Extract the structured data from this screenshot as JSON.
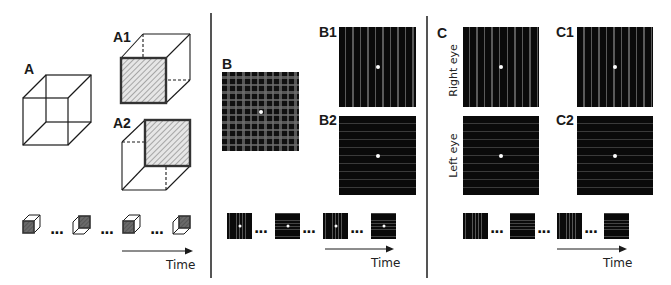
{
  "panels": {
    "A": {
      "label": "A",
      "sub1_label": "A1",
      "sub2_label": "A2",
      "stimulus": "necker-cube",
      "sequence_count": 4,
      "separator": "...",
      "time_label": "Time"
    },
    "B": {
      "label": "B",
      "sub1_label": "B1",
      "sub2_label": "B2",
      "stimulus": "plaid-grating",
      "sequence_count": 4,
      "separator": "...",
      "time_label": "Time"
    },
    "C": {
      "label": "C",
      "sub1_label": "C1",
      "sub2_label": "C2",
      "right_eye_label": "Right eye",
      "left_eye_label": "Left eye",
      "stimulus": "binocular-rivalry-gratings",
      "sequence_count": 4,
      "separator": "...",
      "time_label": "Time"
    }
  },
  "colors": {
    "background": "#ffffff",
    "line": "#1a1a1a",
    "divider": "#555555",
    "grating_dark": "#0a0a0a",
    "grating_light": "#5a5a5a",
    "hatch_face": "#d0d0d0",
    "cube_dark_face": "#555555",
    "fixation": "#ffffff"
  }
}
